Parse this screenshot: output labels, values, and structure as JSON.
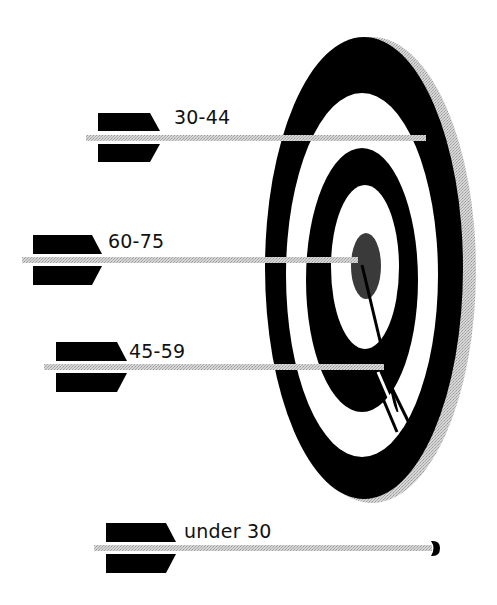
{
  "diagram": {
    "type": "target-with-arrows",
    "colors": {
      "ring_dark": "#000000",
      "ring_light": "#ffffff",
      "rim": "#c8c8c8",
      "bullseye": "#3a3a3a",
      "shaft": "#c4c4c4",
      "fletching": "#000000",
      "text": "#111111"
    },
    "arrows": [
      {
        "label": "30-44",
        "hit": "second ring from outside"
      },
      {
        "label": "60-75",
        "hit": "bull's-eye"
      },
      {
        "label": "45-59",
        "hit": "third ring"
      },
      {
        "label": "under 30",
        "hit": "missed target"
      }
    ]
  }
}
